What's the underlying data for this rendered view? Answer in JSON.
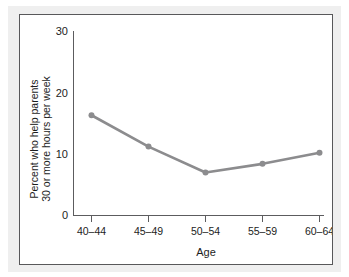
{
  "chart_data": {
    "type": "line",
    "title": "",
    "xlabel": "Age",
    "ylabel_line1": "Percent who help parents",
    "ylabel_line2": "30 or more hours per week",
    "categories": [
      "40–44",
      "45–49",
      "50–54",
      "55–59",
      "60–64"
    ],
    "values": [
      16.3,
      11.2,
      7.0,
      8.4,
      10.2
    ],
    "series": [
      {
        "name": "Percent who help parents 30 or more hours per week",
        "values": [
          16.3,
          11.2,
          7.0,
          8.4,
          10.2
        ]
      }
    ],
    "ylim": [
      0,
      30
    ],
    "yticks": [
      0,
      10,
      20,
      30
    ],
    "ytick_labels": [
      "0",
      "10",
      "20",
      "30"
    ],
    "grid": false,
    "legend": false,
    "legend_position": "none",
    "line_color": "#8c8c8e",
    "marker_color": "#8c8c8e",
    "axis_color": "#5c5c5e",
    "frame_color": "#58585a",
    "background_color": "#ffffff",
    "page_background_color": "#efefef"
  }
}
